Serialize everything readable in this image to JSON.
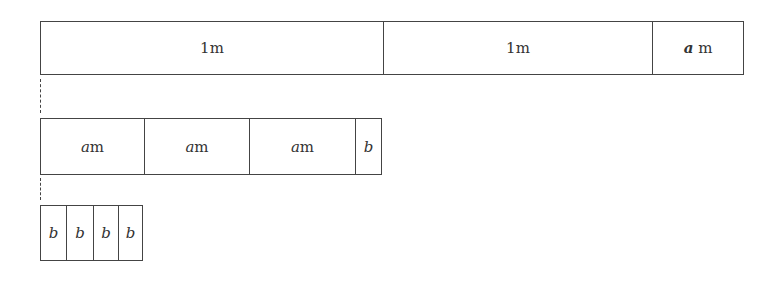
{
  "diagram": {
    "row1": {
      "segments": [
        {
          "var": "",
          "unit": "1m"
        },
        {
          "var": "",
          "unit": "1m"
        },
        {
          "var": "a",
          "unit": " m"
        }
      ]
    },
    "row2": {
      "segments": [
        {
          "var": "a",
          "unit": "m"
        },
        {
          "var": "a",
          "unit": "m"
        },
        {
          "var": "a",
          "unit": "m"
        },
        {
          "var": "b",
          "unit": ""
        }
      ]
    },
    "row3": {
      "segments": [
        {
          "var": "b",
          "unit": ""
        },
        {
          "var": "b",
          "unit": ""
        },
        {
          "var": "b",
          "unit": ""
        },
        {
          "var": "b",
          "unit": ""
        }
      ]
    },
    "colors": {
      "line": "#444444",
      "text": "#333333",
      "background": "#ffffff"
    }
  }
}
